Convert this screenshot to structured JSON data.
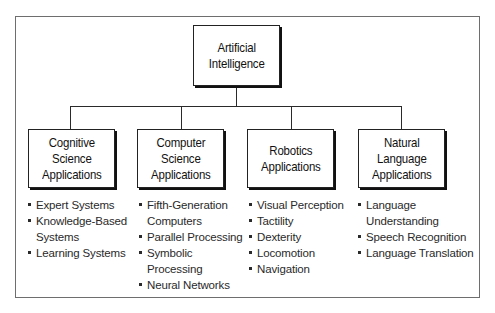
{
  "diagram": {
    "root": {
      "label": "Artificial\nIntelligence"
    },
    "branches": [
      {
        "id": "cognitive",
        "label": "Cognitive\nScience\nApplications",
        "items": [
          "Expert Systems",
          "Knowledge-Based\nSystems",
          "Learning Systems"
        ]
      },
      {
        "id": "computer",
        "label": "Computer\nScience\nApplications",
        "items": [
          "Fifth-Generation\nComputers",
          "Parallel Processing",
          "Symbolic\nProcessing",
          "Neural Networks"
        ]
      },
      {
        "id": "robotics",
        "label": "Robotics\nApplications",
        "items": [
          "Visual Perception",
          "Tactility",
          "Dexterity",
          "Locomotion",
          "Navigation"
        ]
      },
      {
        "id": "natural-language",
        "label": "Natural\nLanguage\nApplications",
        "items": [
          "Language\nUnderstanding",
          "Speech Recognition",
          "Language Translation"
        ]
      }
    ]
  },
  "colors": {
    "border": "#222222",
    "shadow": "#111111",
    "frame": "#6e6e6e",
    "text": "#1a1a1a"
  }
}
